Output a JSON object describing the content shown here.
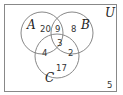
{
  "diagram": {
    "type": "venn",
    "universe_label": "U",
    "sets": [
      {
        "label": "A"
      },
      {
        "label": "B"
      },
      {
        "label": "C"
      }
    ],
    "regions": {
      "A_only": "20",
      "B_only": "8",
      "C_only": "17",
      "A_and_B_only": "9",
      "A_and_C_only": "4",
      "B_and_C_only": "2",
      "A_and_B_and_C": "3",
      "outside": "5"
    },
    "colors": {
      "stroke": "#888888",
      "text": "#333333",
      "background": "#ffffff"
    }
  }
}
